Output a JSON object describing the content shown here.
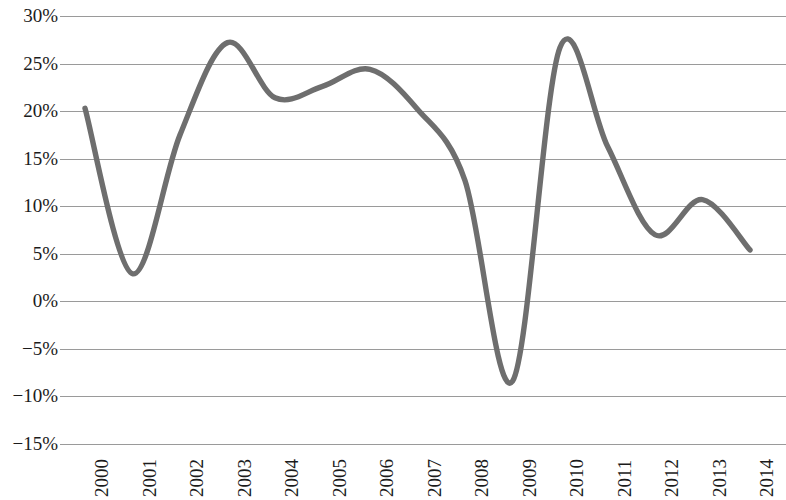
{
  "chart_data": {
    "type": "line",
    "title": "",
    "subtitle": "",
    "xlabel": "",
    "ylabel": "",
    "grid": true,
    "legend": false,
    "legend_position": "none",
    "line_color": "#6e6e6e",
    "gridline_color": "#9a9a9a",
    "background_color": "#ffffff",
    "ylim": [
      -15,
      30
    ],
    "ytick_values": [
      30,
      25,
      20,
      15,
      10,
      5,
      0,
      -5,
      -10,
      -15
    ],
    "ytick_labels": [
      "30%",
      "25%",
      "20%",
      "15%",
      "10%",
      "5%",
      "0%",
      "−5%",
      "−10%",
      "−15%"
    ],
    "xlim": [
      "2000",
      "2014"
    ],
    "categories": [
      "2000",
      "2001",
      "2002",
      "2003",
      "2004",
      "2005",
      "2006",
      "2007",
      "2008",
      "2009",
      "2010",
      "2011",
      "2012",
      "2013",
      "2014"
    ],
    "xtick_labels": [
      "2000",
      "2001",
      "2002",
      "2003",
      "2004",
      "2005",
      "2006",
      "2007",
      "2008",
      "2009",
      "2010",
      "2011",
      "2012",
      "2013",
      "2014"
    ],
    "xtick_rotation": 90,
    "series": [
      {
        "name": "",
        "values": [
          20.3,
          2.9,
          17.5,
          27.2,
          21.4,
          22.6,
          24.4,
          20.2,
          12.7,
          -8.4,
          26.7,
          16.3,
          7.0,
          10.7,
          5.4
        ]
      }
    ],
    "value_unit": "%",
    "annotations": []
  },
  "axes": {
    "y_axis_name": "y-axis",
    "x_axis_name": "x-axis"
  }
}
